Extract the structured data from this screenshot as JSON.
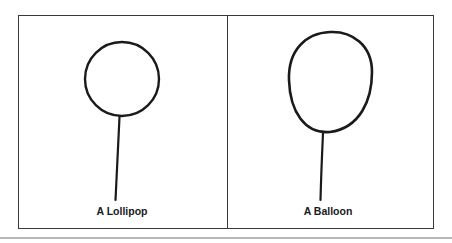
{
  "figure": {
    "panels": [
      {
        "id": "lollipop",
        "label": "A Lollipop",
        "shape": "circle-on-stick"
      },
      {
        "id": "balloon",
        "label": "A Balloon",
        "shape": "oval-on-string"
      }
    ],
    "colors": {
      "stroke": "#1a1a1a",
      "border": "#3a3a3a",
      "separator": "#b8b8b8",
      "background": "#ffffff"
    }
  }
}
